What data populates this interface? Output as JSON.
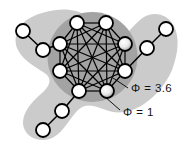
{
  "figure": {
    "title": "",
    "type": "network-diagram",
    "background_color": "#ffffff"
  },
  "regions": [
    {
      "id": "outer-complex",
      "name": "outer-complex-blob",
      "label": "Φ = 1",
      "phi_symbol": "Φ",
      "phi_value": "1",
      "fill_color": "#cbcbcb",
      "shape": "amoeba"
    },
    {
      "id": "main-complex",
      "name": "main-complex-core",
      "label": "Φ = 3.6",
      "phi_symbol": "Φ",
      "phi_value": "3.6",
      "fill_color": "#a3a3a3",
      "shape": "circle"
    }
  ],
  "labels": {
    "core_label": "Φ = 3.6",
    "outer_label": "Φ = 1"
  },
  "nodes": {
    "core": [
      {
        "id": "c1",
        "x": 77,
        "y": 23,
        "highlight": false
      },
      {
        "id": "c2",
        "x": 106,
        "y": 23,
        "highlight": false
      },
      {
        "id": "c3",
        "x": 125,
        "y": 44,
        "highlight": true
      },
      {
        "id": "c4",
        "x": 125,
        "y": 71,
        "highlight": false
      },
      {
        "id": "c5",
        "x": 107,
        "y": 91,
        "highlight": true
      },
      {
        "id": "c6",
        "x": 79,
        "y": 91,
        "highlight": false
      },
      {
        "id": "c7",
        "x": 60,
        "y": 71,
        "highlight": false
      },
      {
        "id": "c8",
        "x": 60,
        "y": 44,
        "highlight": false
      }
    ],
    "peripheral": [
      {
        "id": "p1",
        "x": 23,
        "y": 31,
        "highlight": false,
        "branch": "upper-left"
      },
      {
        "id": "p2",
        "x": 43,
        "y": 50,
        "highlight": false,
        "branch": "upper-left"
      },
      {
        "id": "p3",
        "x": 166,
        "y": 29,
        "highlight": false,
        "branch": "upper-right"
      },
      {
        "id": "p4",
        "x": 147,
        "y": 48,
        "highlight": false,
        "branch": "upper-right"
      },
      {
        "id": "p5",
        "x": 62,
        "y": 111,
        "highlight": false,
        "branch": "lower-left"
      },
      {
        "id": "p6",
        "x": 43,
        "y": 130,
        "highlight": false,
        "branch": "lower-left"
      }
    ]
  },
  "edges": {
    "core_edges": [
      [
        "c1",
        "c2"
      ],
      [
        "c1",
        "c3"
      ],
      [
        "c1",
        "c4"
      ],
      [
        "c1",
        "c5"
      ],
      [
        "c1",
        "c6"
      ],
      [
        "c1",
        "c7"
      ],
      [
        "c1",
        "c8"
      ],
      [
        "c2",
        "c3"
      ],
      [
        "c2",
        "c4"
      ],
      [
        "c2",
        "c5"
      ],
      [
        "c2",
        "c6"
      ],
      [
        "c2",
        "c7"
      ],
      [
        "c2",
        "c8"
      ],
      [
        "c3",
        "c4"
      ],
      [
        "c3",
        "c5"
      ],
      [
        "c3",
        "c6"
      ],
      [
        "c3",
        "c7"
      ],
      [
        "c3",
        "c8"
      ],
      [
        "c4",
        "c5"
      ],
      [
        "c4",
        "c6"
      ],
      [
        "c4",
        "c7"
      ],
      [
        "c4",
        "c8"
      ],
      [
        "c5",
        "c6"
      ],
      [
        "c5",
        "c7"
      ],
      [
        "c5",
        "c8"
      ],
      [
        "c6",
        "c7"
      ],
      [
        "c6",
        "c8"
      ],
      [
        "c7",
        "c8"
      ]
    ],
    "peripheral_edges": [
      [
        "p1",
        "p2"
      ],
      [
        "p2",
        "c8"
      ],
      [
        "p3",
        "p4"
      ],
      [
        "p4",
        "c4"
      ],
      [
        "c6",
        "p5"
      ],
      [
        "p5",
        "p6"
      ]
    ]
  },
  "leaders": [
    {
      "id": "leader-core",
      "from_x": 128,
      "from_y": 88,
      "to_x": 113,
      "to_y": 78
    },
    {
      "id": "leader-outer",
      "from_x": 120,
      "from_y": 110,
      "to_x": 104,
      "to_y": 96
    }
  ],
  "style": {
    "node_fill": "#ffffff",
    "node_stroke": "#000000",
    "node_radius": 7,
    "edge_color": "#000000",
    "highlight_fill": "#f2f2f2"
  }
}
